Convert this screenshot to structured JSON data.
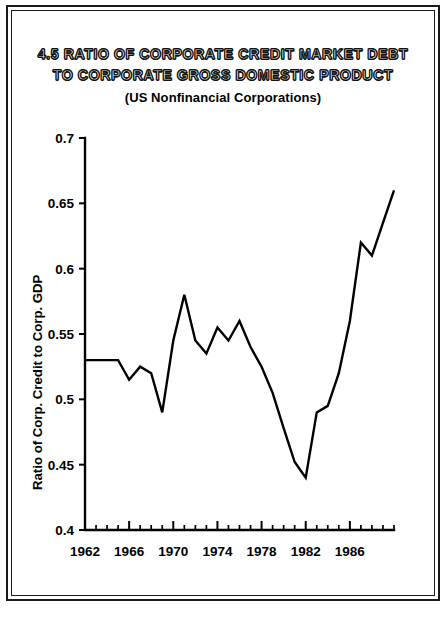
{
  "figure": {
    "number": "4.5",
    "title_line1": "4.5  RATIO OF CORPORATE CREDIT MARKET DEBT",
    "title_line2": "TO CORPORATE GROSS DOMESTIC PRODUCT",
    "subtitle": "(US Nonfinancial Corporations)"
  },
  "chart_data": {
    "type": "line",
    "title": "4.5 RATIO OF CORPORATE CREDIT MARKET DEBT TO CORPORATE GROSS DOMESTIC PRODUCT",
    "subtitle": "(US Nonfinancial Corporations)",
    "xlabel": "",
    "ylabel": "Ratio of Corp. Credit to Corp. GDP",
    "xlim": [
      1962,
      1990
    ],
    "ylim": [
      0.4,
      0.7
    ],
    "grid": false,
    "legend": null,
    "y_ticks": [
      0.4,
      0.45,
      0.5,
      0.55,
      0.6,
      0.65,
      0.7
    ],
    "y_tick_labels": [
      "0.4",
      "0.45",
      "0.5",
      "0.55",
      "0.6",
      "0.65",
      "0.7"
    ],
    "x_ticks_major": [
      1962,
      1966,
      1970,
      1974,
      1978,
      1982,
      1986
    ],
    "x_tick_labels": [
      "1962",
      "1966",
      "1970",
      "1974",
      "1978",
      "1982",
      "1986"
    ],
    "x_minor_tick_step": 1,
    "x": [
      1962,
      1963,
      1964,
      1965,
      1966,
      1967,
      1968,
      1969,
      1970,
      1971,
      1972,
      1973,
      1974,
      1975,
      1976,
      1977,
      1978,
      1979,
      1980,
      1981,
      1982,
      1983,
      1984,
      1985,
      1986,
      1987,
      1988,
      1989,
      1990
    ],
    "values": [
      0.53,
      0.53,
      0.53,
      0.53,
      0.515,
      0.525,
      0.52,
      0.49,
      0.545,
      0.58,
      0.545,
      0.535,
      0.555,
      0.545,
      0.56,
      0.54,
      0.525,
      0.505,
      0.478,
      0.452,
      0.44,
      0.49,
      0.495,
      0.52,
      0.56,
      0.62,
      0.61,
      0.635,
      0.66
    ],
    "series": [
      {
        "name": "Ratio of Corp. Credit to Corp. GDP",
        "values": [
          0.53,
          0.53,
          0.53,
          0.53,
          0.515,
          0.525,
          0.52,
          0.49,
          0.545,
          0.58,
          0.545,
          0.535,
          0.555,
          0.545,
          0.56,
          0.54,
          0.525,
          0.505,
          0.478,
          0.452,
          0.44,
          0.49,
          0.495,
          0.52,
          0.56,
          0.62,
          0.61,
          0.635,
          0.66
        ],
        "color": "#000000"
      }
    ],
    "annotations": []
  },
  "colors": {
    "line": "#000000",
    "axis": "#000000",
    "background": "#ffffff",
    "frame": "#1a1a1a"
  }
}
